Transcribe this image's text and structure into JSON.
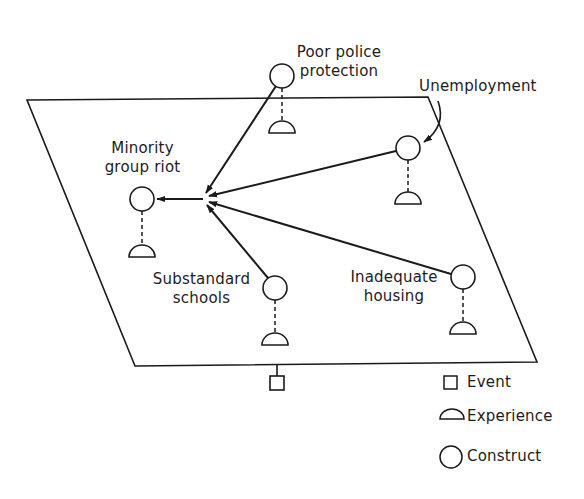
{
  "diagram": {
    "type": "causal-network",
    "plane": {
      "shape": "parallelogram",
      "points": [
        [
          27,
          100
        ],
        [
          428,
          97
        ],
        [
          537,
          362
        ],
        [
          135,
          366
        ]
      ]
    },
    "nodes": [
      {
        "id": "riot",
        "label_line1": "Minority",
        "label_line2": "group riot",
        "construct": [
          142,
          199
        ],
        "experience": [
          142,
          255
        ]
      },
      {
        "id": "police",
        "label_line1": "Poor police",
        "label_line2": "protection",
        "construct": [
          282,
          76
        ],
        "experience": [
          282,
          132
        ]
      },
      {
        "id": "unemployment",
        "label_line1": "Unemployment",
        "label_line2": "",
        "construct": [
          408,
          148
        ],
        "experience": [
          408,
          203
        ]
      },
      {
        "id": "schools",
        "label_line1": "Substandard",
        "label_line2": "schools",
        "construct": [
          275,
          288
        ],
        "experience": [
          275,
          344
        ]
      },
      {
        "id": "housing",
        "label_line1": "Inadequate",
        "label_line2": "housing",
        "construct": [
          463,
          277
        ],
        "experience": [
          463,
          333
        ]
      }
    ],
    "edges": [
      {
        "from": "police",
        "to": "riot"
      },
      {
        "from": "unemployment",
        "to": "riot"
      },
      {
        "from": "schools",
        "to": "riot"
      },
      {
        "from": "housing",
        "to": "riot"
      }
    ],
    "event": {
      "position": [
        277,
        383
      ]
    },
    "legend": [
      {
        "symbol": "square",
        "label": "Event"
      },
      {
        "symbol": "half-circle",
        "label": "Experience"
      },
      {
        "symbol": "circle",
        "label": "Construct"
      }
    ]
  },
  "colors": {
    "ink": "#1a1a1a",
    "background": "#ffffff"
  }
}
